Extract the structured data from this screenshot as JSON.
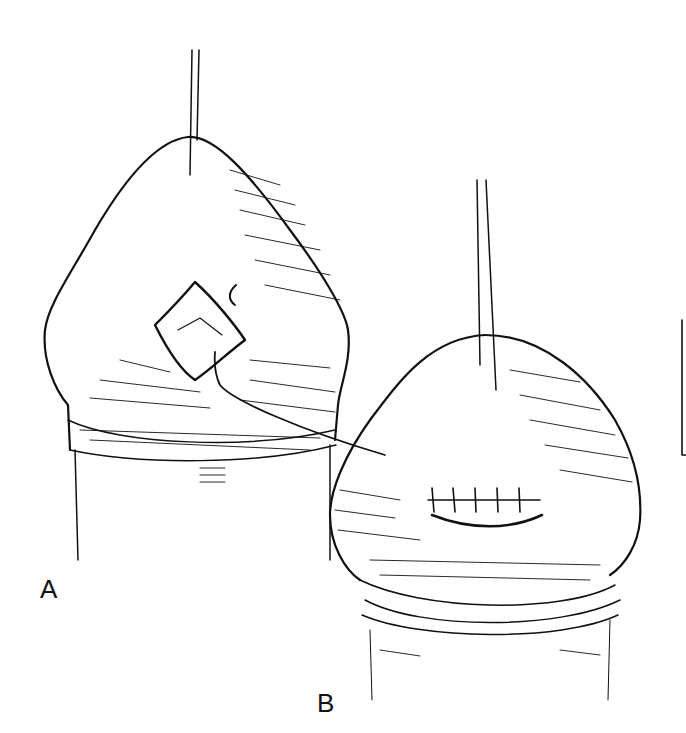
{
  "figure": {
    "panels": [
      {
        "id": "A",
        "label": "A",
        "description": "Incision with opening, suture thread exiting"
      },
      {
        "id": "B",
        "label": "B",
        "description": "Closed incision with interrupted sutures"
      }
    ],
    "colors": {
      "line": "#111111",
      "background": "#ffffff"
    }
  }
}
